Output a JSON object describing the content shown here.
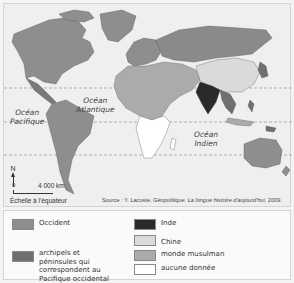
{
  "map": {
    "ocean_labels": {
      "pacific": "Océan\nPacifique",
      "atlantic": "Océan\nAtlantique",
      "indian": "Océan\nIndien"
    },
    "north_label": "N",
    "scale_zero": "0",
    "scale_distance": "4 000 km",
    "scale_note": "Échelle à l'équateur",
    "source_prefix": "Source : Y. Lacoste, ",
    "source_title": "Géopolitique. La longue histoire d'aujourd'hui",
    "source_suffix": ", 2009."
  },
  "legend": {
    "items": [
      {
        "label": "Occident",
        "color": "#8e8e8e"
      },
      {
        "label": "archipels et péninsules qui correspondent au Pacifique occidental",
        "color": "#6f6f6f"
      },
      {
        "label": "Inde",
        "color": "#2a2a2a"
      },
      {
        "label": "Chine",
        "color": "#dadada"
      },
      {
        "label": "monde musulman",
        "color": "#ababab"
      },
      {
        "label": "aucune donnée",
        "color": "#ffffff"
      }
    ]
  },
  "colors": {
    "ocean": "#efefef",
    "occident": "#8e8e8e",
    "pacific": "#6f6f6f",
    "inde": "#2a2a2a",
    "chine": "#dadada",
    "muslim": "#ababab",
    "nodata": "#ffffff",
    "russia": "#8a8a8a"
  }
}
